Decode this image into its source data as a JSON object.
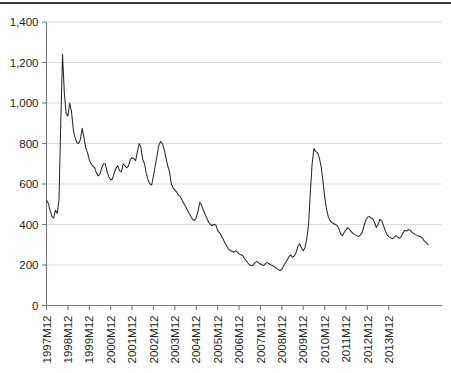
{
  "chart_data": {
    "type": "line",
    "title": "",
    "subtitle": "",
    "xlabel": "",
    "ylabel": "",
    "grid": true,
    "legend": null,
    "ylim": [
      0,
      1400
    ],
    "ytick_step": 200,
    "ytick_labels": [
      "0",
      "200",
      "400",
      "600",
      "800",
      "1,000",
      "1,200",
      "1,400"
    ],
    "ytick_values": [
      0,
      200,
      400,
      600,
      800,
      1000,
      1200,
      1400
    ],
    "xtick_labels": [
      "1997M12",
      "1998M12",
      "1999M12",
      "2000M12",
      "2001M12",
      "2002M12",
      "2003M12",
      "2004M12",
      "2005M12",
      "2006M12",
      "2007M12",
      "2008M12",
      "2009M12",
      "2010M12",
      "2011M12",
      "2012M12",
      "2013M12"
    ],
    "x_start": "1997M12",
    "x_end": "2014M06",
    "x_frequency": "monthly",
    "series": [
      {
        "name": "series-1",
        "color": "#2b2b2b",
        "values": [
          520,
          505,
          470,
          440,
          432,
          470,
          455,
          520,
          900,
          1240,
          1050,
          950,
          935,
          1000,
          960,
          870,
          830,
          805,
          800,
          820,
          875,
          830,
          780,
          755,
          720,
          700,
          690,
          680,
          655,
          640,
          650,
          680,
          700,
          700,
          660,
          635,
          620,
          625,
          655,
          680,
          690,
          665,
          660,
          700,
          690,
          680,
          690,
          720,
          730,
          725,
          715,
          760,
          800,
          780,
          720,
          700,
          650,
          620,
          600,
          595,
          640,
          690,
          740,
          790,
          810,
          800,
          770,
          730,
          690,
          660,
          600,
          580,
          570,
          560,
          545,
          540,
          520,
          505,
          490,
          470,
          455,
          440,
          425,
          420,
          435,
          465,
          510,
          495,
          470,
          450,
          430,
          410,
          400,
          395,
          400,
          398,
          370,
          360,
          345,
          330,
          310,
          295,
          280,
          272,
          268,
          262,
          270,
          265,
          255,
          250,
          248,
          232,
          222,
          210,
          200,
          196,
          200,
          212,
          218,
          210,
          205,
          200,
          198,
          208,
          212,
          205,
          200,
          196,
          190,
          185,
          178,
          172,
          180,
          195,
          210,
          225,
          240,
          250,
          238,
          245,
          262,
          290,
          305,
          285,
          270,
          285,
          330,
          400,
          560,
          700,
          775,
          760,
          755,
          730,
          690,
          620,
          540,
          480,
          440,
          420,
          410,
          405,
          400,
          395,
          380,
          355,
          345,
          360,
          375,
          385,
          375,
          365,
          355,
          350,
          345,
          340,
          348,
          360,
          390,
          420,
          435,
          440,
          432,
          430,
          410,
          385,
          400,
          425,
          420,
          395,
          370,
          350,
          340,
          335,
          330,
          335,
          345,
          338,
          332,
          340,
          360,
          372,
          368,
          375,
          372,
          362,
          355,
          350,
          345,
          342,
          340,
          330,
          318,
          310,
          300
        ]
      }
    ]
  },
  "axis": {
    "y_axis_name": "y-axis",
    "x_axis_name": "x-axis"
  }
}
